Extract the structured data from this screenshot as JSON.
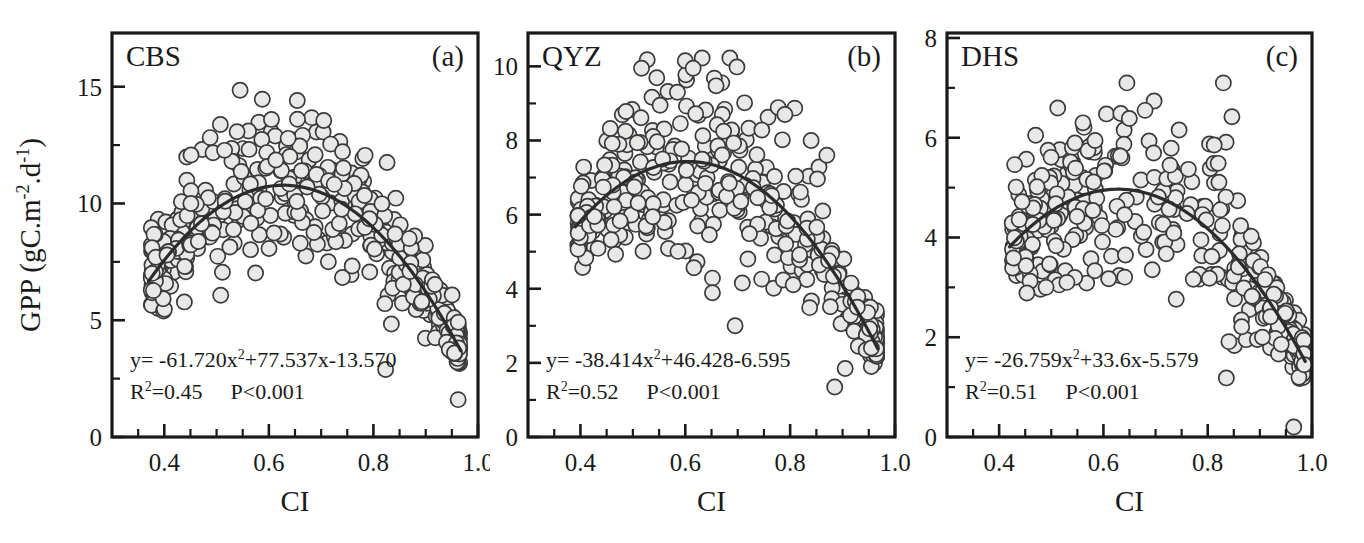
{
  "figure": {
    "width": 1364,
    "height": 543,
    "background": "#ffffff",
    "ink_color": "#1a1a1a",
    "marker_fill": "#e8e8e6",
    "marker_stroke": "#3a3a3a",
    "curve_color": "#2b2b2b"
  },
  "shared": {
    "y_axis_label": "GPP (gC.m",
    "y_axis_label_sup1": "-2",
    "y_axis_label_mid": ".d",
    "y_axis_label_sup2": "-1",
    "y_axis_label_end": ")",
    "x_axis_label": "CI",
    "p_value": "P<0.001"
  },
  "chart_data": [
    {
      "type": "scatter",
      "panel_letter": "(a)",
      "title": "CBS",
      "xlabel": "CI",
      "ylabel": "GPP (gC.m-2.d-1)",
      "xlim": [
        0.3,
        1.0
      ],
      "ylim": [
        0,
        17.3
      ],
      "xticks": [
        0.4,
        0.6,
        0.8,
        1.0
      ],
      "xtick_labels": [
        "0.4",
        "0.6",
        "0.8",
        "1.0"
      ],
      "x_minor_step": 0.05,
      "yticks": [
        0,
        5,
        10,
        15
      ],
      "ytick_labels": [
        "0",
        "5",
        "10",
        "15"
      ],
      "y_minor_step": 2.5,
      "grid": false,
      "equation": "y= -61.720x",
      "equation_sup": "2",
      "equation_rest": "+77.537x-13.570",
      "fit": {
        "a": -61.72,
        "b": 77.537,
        "c": -13.57
      },
      "r2_label": "R",
      "r2_sup": "2",
      "r2_value": "=0.45",
      "p_value": "P<0.001",
      "n_points": 470,
      "x_range_data": [
        0.375,
        0.965
      ],
      "scatter_sd": 1.42,
      "seed": 11,
      "marker_radius": 7.6,
      "outliers": [
        {
          "x": 0.545,
          "y": 14.85
        },
        {
          "x": 0.605,
          "y": 13.6
        },
        {
          "x": 0.705,
          "y": 13.55
        },
        {
          "x": 0.945,
          "y": 3.75
        },
        {
          "x": 0.955,
          "y": 3.6
        },
        {
          "x": 0.962,
          "y": 1.6
        }
      ]
    },
    {
      "type": "scatter",
      "panel_letter": "(b)",
      "title": "QYZ",
      "xlabel": "CI",
      "ylabel": "GPP (gC.m-2.d-1)",
      "xlim": [
        0.3,
        1.0
      ],
      "ylim": [
        0,
        10.9
      ],
      "xticks": [
        0.4,
        0.6,
        0.8,
        1.0
      ],
      "xtick_labels": [
        "0.4",
        "0.6",
        "0.8",
        "1.0"
      ],
      "x_minor_step": 0.05,
      "yticks": [
        0,
        2,
        4,
        6,
        8,
        10
      ],
      "ytick_labels": [
        "0",
        "2",
        "4",
        "6",
        "8",
        "10"
      ],
      "y_minor_step": 1,
      "grid": false,
      "equation": "y= -38.414x",
      "equation_sup": "2",
      "equation_rest": "+46.428-6.595",
      "fit": {
        "a": -38.414,
        "b": 46.428,
        "c": -6.595
      },
      "r2_label": "R",
      "r2_sup": "2",
      "r2_value": "=0.52",
      "p_value": "P<0.001",
      "n_points": 430,
      "x_range_data": [
        0.395,
        0.965
      ],
      "scatter_sd": 1.05,
      "seed": 29,
      "marker_radius": 7.6,
      "outliers": [
        {
          "x": 0.6,
          "y": 10.15
        },
        {
          "x": 0.615,
          "y": 9.95
        },
        {
          "x": 0.585,
          "y": 9.3
        },
        {
          "x": 0.695,
          "y": 3.0
        },
        {
          "x": 0.885,
          "y": 1.35
        },
        {
          "x": 0.905,
          "y": 1.85
        },
        {
          "x": 0.93,
          "y": 2.45
        },
        {
          "x": 0.945,
          "y": 2.35
        },
        {
          "x": 0.955,
          "y": 2.4
        },
        {
          "x": 0.87,
          "y": 7.6
        },
        {
          "x": 0.84,
          "y": 8.0
        },
        {
          "x": 0.79,
          "y": 8.7
        }
      ]
    },
    {
      "type": "scatter",
      "panel_letter": "(c)",
      "title": "DHS",
      "xlabel": "CI",
      "ylabel": "GPP (gC.m-2.d-1)",
      "xlim": [
        0.3,
        1.0
      ],
      "ylim": [
        0,
        8.1
      ],
      "xticks": [
        0.4,
        0.6,
        0.8,
        1.0
      ],
      "xtick_labels": [
        "0.4",
        "0.6",
        "0.8",
        "1.0"
      ],
      "x_minor_step": 0.05,
      "yticks": [
        0,
        2,
        4,
        6,
        8
      ],
      "ytick_labels": [
        "0",
        "2",
        "4",
        "6",
        "8"
      ],
      "y_minor_step": 1,
      "grid": false,
      "equation": "y= -26.759x",
      "equation_sup": "2",
      "equation_rest": "+33.6x-5.579",
      "fit": {
        "a": -26.759,
        "b": 33.6,
        "c": -5.579
      },
      "r2_label": "R",
      "r2_sup": "2",
      "r2_value": "=0.51",
      "p_value": "P<0.001",
      "n_points": 400,
      "x_range_data": [
        0.425,
        0.985
      ],
      "scatter_sd": 0.82,
      "seed": 47,
      "marker_radius": 7.6,
      "outliers": [
        {
          "x": 0.645,
          "y": 7.1
        },
        {
          "x": 0.83,
          "y": 7.1
        },
        {
          "x": 0.47,
          "y": 6.05
        },
        {
          "x": 0.49,
          "y": 3.0
        },
        {
          "x": 0.545,
          "y": 3.2
        },
        {
          "x": 0.53,
          "y": 3.1
        },
        {
          "x": 0.905,
          "y": 2.0
        },
        {
          "x": 0.965,
          "y": 0.2
        },
        {
          "x": 0.975,
          "y": 1.2
        },
        {
          "x": 0.985,
          "y": 1.45
        }
      ]
    }
  ],
  "panels_layout": [
    {
      "left": 0,
      "width": 490,
      "plot_x0": 112,
      "plot_x1": 478,
      "plot_y0": 33,
      "plot_y1": 437
    },
    {
      "left": 490,
      "width": 430,
      "plot_x0": 38,
      "plot_x1": 405,
      "plot_y0": 33,
      "plot_y1": 437
    },
    {
      "left": 920,
      "width": 444,
      "plot_x0": 27,
      "plot_x1": 392,
      "plot_y0": 33,
      "plot_y1": 437
    }
  ]
}
